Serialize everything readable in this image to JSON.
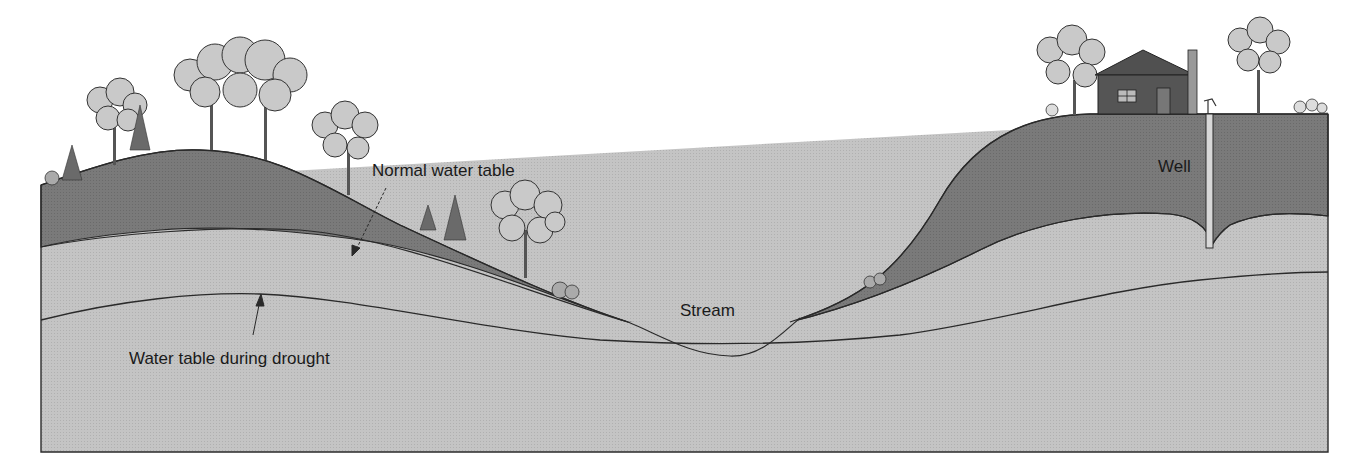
{
  "diagram": {
    "type": "groundwater cross-section",
    "labels": {
      "normal_water_table": "Normal water table",
      "drought_water_table": "Water table during drought",
      "stream": "Stream",
      "well": "Well"
    },
    "colors": {
      "unsaturated_zone": "#7a7a7a",
      "saturated_zone": "#c4c4c4",
      "outline": "#2a2a2a",
      "tree_canopy": "#c9c9c9",
      "house": "#555555",
      "background": "#ffffff"
    },
    "features": [
      "hill-left",
      "trees",
      "stream-valley",
      "hill-right",
      "house",
      "well",
      "chimney",
      "pump"
    ]
  }
}
